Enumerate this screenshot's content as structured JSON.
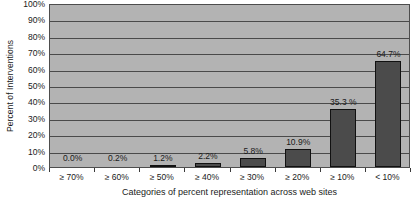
{
  "chart_data": {
    "type": "bar",
    "title": "",
    "xlabel": "Categories of percent representation across web sites",
    "ylabel": "Percent of Interventions",
    "categories": [
      "≥ 70%",
      "≥ 60%",
      "≥ 50%",
      "≥ 40%",
      "≥ 30%",
      "≥ 20%",
      "≥ 10%",
      "< 10%"
    ],
    "values": [
      0.0,
      0.2,
      1.2,
      2.2,
      5.8,
      10.9,
      35.3,
      64.7
    ],
    "data_labels": [
      "0.0%",
      "0.2%",
      "1.2%",
      "2.2%",
      "5.8%",
      "10.9%",
      "35.3 %",
      "64.7%"
    ],
    "ylim": [
      0,
      100
    ],
    "ytick_labels": [
      "0%",
      "10%",
      "20%",
      "30%",
      "40%",
      "50%",
      "60%",
      "70%",
      "80%",
      "90%",
      "100%"
    ],
    "ytick_values": [
      0,
      10,
      20,
      30,
      40,
      50,
      60,
      70,
      80,
      90,
      100
    ],
    "grid": true,
    "legend": false,
    "colors": {
      "bar_fill": "#4b4b4b",
      "bar_border": "#111111",
      "plot_background": "#b3b3b3",
      "gridline": "#4a4a4a",
      "axis": "#3a3a3a",
      "text": "#1a1a1a",
      "page_background": "#ffffff"
    }
  }
}
